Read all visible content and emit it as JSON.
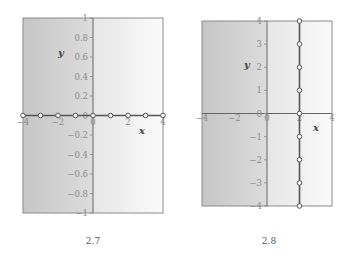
{
  "chart_data": [
    {
      "type": "scatter",
      "caption": "2.7",
      "title": "",
      "xlabel": "x",
      "ylabel": "y",
      "xlim": [
        -4,
        4
      ],
      "ylim": [
        -1,
        1
      ],
      "xticks": [
        "-4",
        "-2",
        "0",
        "2",
        "4"
      ],
      "yticks": [
        "1",
        "0.8",
        "0.6",
        "0.4",
        "0.2",
        "0",
        "-0.2",
        "-0.4",
        "-0.6",
        "-0.8",
        "-1"
      ],
      "grid": false,
      "legend": null,
      "series": [
        {
          "name": "y = 0",
          "connected": true,
          "marker": "open-circle",
          "x": [
            -4,
            -3,
            -2,
            -1,
            0,
            1,
            2,
            3,
            4
          ],
          "y": [
            0,
            0,
            0,
            0,
            0,
            0,
            0,
            0,
            0
          ]
        }
      ]
    },
    {
      "type": "scatter",
      "caption": "2.8",
      "title": "",
      "xlabel": "x",
      "ylabel": "y",
      "xlim": [
        -4,
        4
      ],
      "ylim": [
        -4,
        4
      ],
      "xticks": [
        "-4",
        "-2",
        "0",
        "2",
        "4"
      ],
      "yticks": [
        "4",
        "3",
        "2",
        "1",
        "0",
        "-1",
        "-2",
        "-3",
        "-4"
      ],
      "grid": false,
      "legend": null,
      "series": [
        {
          "name": "x = 2",
          "connected": true,
          "marker": "open-circle",
          "x": [
            2,
            2,
            2,
            2,
            2,
            2,
            2,
            2,
            2
          ],
          "y": [
            4,
            3,
            2,
            1,
            0,
            -1,
            -2,
            -3,
            -4
          ]
        }
      ]
    }
  ],
  "colors": {
    "panel_left_shade": "#c8c8c8",
    "panel_right_shade": "#fbfbfb",
    "axis_line": "#555555",
    "data_line": "#555555",
    "frame": "#8a8a8a"
  }
}
